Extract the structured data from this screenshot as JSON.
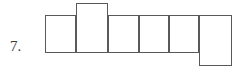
{
  "figure": {
    "item_number": "7.",
    "stroke_color": "#595959",
    "fill_color": "#ffffff",
    "background_color": "#ffffff",
    "stroke_width": 1.4,
    "canvas": {
      "width": 244,
      "height": 73
    },
    "cells": [
      {
        "name": "square-left",
        "x": 45,
        "y": 15,
        "width": 31,
        "height": 38
      },
      {
        "name": "rect-top-tab",
        "x": 76,
        "y": 3,
        "width": 32,
        "height": 50
      },
      {
        "name": "square-two",
        "x": 108,
        "y": 15,
        "width": 31,
        "height": 38
      },
      {
        "name": "square-three",
        "x": 139,
        "y": 15,
        "width": 30,
        "height": 38
      },
      {
        "name": "square-four",
        "x": 169,
        "y": 15,
        "width": 30,
        "height": 38
      },
      {
        "name": "rect-bottom-tab",
        "x": 199,
        "y": 15,
        "width": 33,
        "height": 51
      }
    ]
  }
}
